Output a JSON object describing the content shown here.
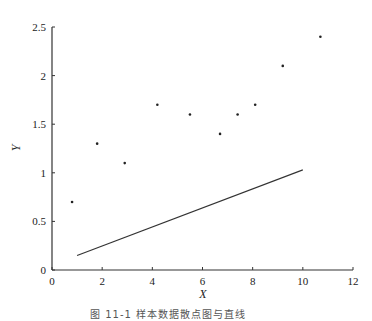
{
  "chart_data": {
    "type": "scatter",
    "title": "",
    "xlabel": "X",
    "ylabel": "Y",
    "xlim": [
      0,
      12
    ],
    "ylim": [
      0,
      2.5
    ],
    "xticks": [
      0,
      2,
      4,
      6,
      8,
      10,
      12
    ],
    "yticks": [
      0,
      0.5,
      1,
      1.5,
      2,
      2.5
    ],
    "xtick_labels": [
      "0",
      "2",
      "4",
      "6",
      "8",
      "10",
      "12"
    ],
    "ytick_labels": [
      "0",
      "0.5",
      "1",
      "1.5",
      "2",
      "2.5"
    ],
    "grid": false,
    "legend": null,
    "series": [
      {
        "name": "data points",
        "type": "scatter",
        "x": [
          0.8,
          1.8,
          2.9,
          4.2,
          5.5,
          6.7,
          7.4,
          8.1,
          9.2,
          10.7
        ],
        "y": [
          0.7,
          1.3,
          1.1,
          1.7,
          1.6,
          1.4,
          1.6,
          1.7,
          2.1,
          2.4
        ]
      },
      {
        "name": "fitted line",
        "type": "line",
        "x": [
          1.0,
          10.0
        ],
        "y": [
          0.15,
          1.03
        ]
      }
    ]
  },
  "caption": "图 11-1  样本数据散点图与直线"
}
